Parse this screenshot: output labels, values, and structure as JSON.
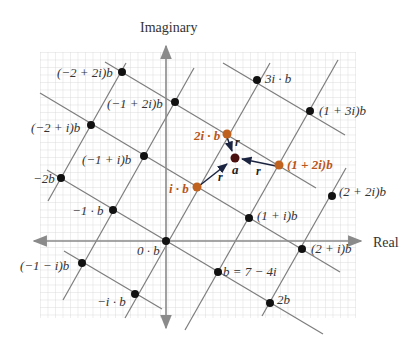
{
  "axes": {
    "real_label": "Real",
    "imaginary_label": "Imaginary"
  },
  "colors": {
    "grid": "#d4d4d4",
    "axis": "#8a8a8a",
    "lattice_line": "#7a7a7a",
    "point": "#111111",
    "highlight": "#c0621f",
    "center": "#4a1010",
    "arrow": "#1a2440"
  },
  "lattice": {
    "origin_px": [
      166,
      241
    ],
    "b_px": [
      52,
      31
    ],
    "ib_px": [
      30,
      -53
    ],
    "generator": "b = 7 − 4i"
  },
  "points": [
    {
      "label": "(−2 + 2i)b",
      "m": -2,
      "n": 2,
      "highlight": false
    },
    {
      "label": "(−1 + 2i)b",
      "m": -1,
      "n": 2,
      "highlight": false
    },
    {
      "label": "3i · b",
      "m": 0,
      "n": 3,
      "highlight": false
    },
    {
      "label": "(1 + 3i)b",
      "m": 1,
      "n": 3,
      "highlight": false
    },
    {
      "label": "(−2 + i)b",
      "m": -2,
      "n": 1,
      "highlight": false
    },
    {
      "label": "(−1 + i)b",
      "m": -1,
      "n": 1,
      "highlight": false
    },
    {
      "label": "2i · b",
      "m": 0,
      "n": 2,
      "highlight": true
    },
    {
      "label": "(1 + 2i)b",
      "m": 1,
      "n": 2,
      "highlight": true
    },
    {
      "label": "i · b",
      "m": 0,
      "n": 1,
      "highlight": true
    },
    {
      "label": "−2b",
      "m": -2,
      "n": 0,
      "highlight": false
    },
    {
      "label": "−1 · b",
      "m": -1,
      "n": 0,
      "highlight": false
    },
    {
      "label": "(1 + i)b",
      "m": 1,
      "n": 1,
      "highlight": false
    },
    {
      "label": "(2 + 2i)b",
      "m": 2,
      "n": 2,
      "highlight": false
    },
    {
      "label": "0 · b",
      "m": 0,
      "n": 0,
      "highlight": false
    },
    {
      "label": "(2 + i)b",
      "m": 2,
      "n": 1,
      "highlight": false
    },
    {
      "label": "(−1 − i)b",
      "m": -1,
      "n": -1,
      "highlight": false
    },
    {
      "label": "b = 7 − 4i",
      "m": 1,
      "n": 0,
      "highlight": false
    },
    {
      "label": "−i · b",
      "m": 0,
      "n": -1,
      "highlight": false
    },
    {
      "label": "2b",
      "m": 2,
      "n": 0,
      "highlight": false
    }
  ],
  "center_point": {
    "label": "a"
  },
  "distance_labels": [
    "r",
    "r",
    "r"
  ]
}
